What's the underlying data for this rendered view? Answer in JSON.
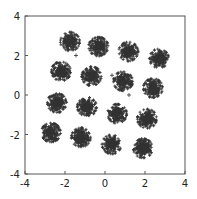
{
  "chart_data": {
    "type": "scatter",
    "title": "",
    "xlabel": "",
    "ylabel": "",
    "xlim": [
      -4,
      4
    ],
    "ylim": [
      -4,
      4
    ],
    "xticks": [
      -4,
      -2,
      0,
      2,
      4
    ],
    "yticks": [
      -4,
      -2,
      0,
      2,
      4
    ],
    "grid": false,
    "legend": null,
    "marker": "+",
    "color": "#333333",
    "cluster_spread": 0.28,
    "points_per_cluster": 260,
    "clusters": [
      {
        "x": -1.75,
        "y": 2.7
      },
      {
        "x": -0.33,
        "y": 2.45
      },
      {
        "x": 1.17,
        "y": 2.2
      },
      {
        "x": 2.7,
        "y": 1.85
      },
      {
        "x": -2.2,
        "y": 1.2
      },
      {
        "x": -0.67,
        "y": 0.95
      },
      {
        "x": 0.9,
        "y": 0.7
      },
      {
        "x": 2.4,
        "y": 0.35
      },
      {
        "x": -2.4,
        "y": -0.4
      },
      {
        "x": -0.9,
        "y": -0.6
      },
      {
        "x": 0.6,
        "y": -0.95
      },
      {
        "x": 2.1,
        "y": -1.2
      },
      {
        "x": -2.7,
        "y": -1.9
      },
      {
        "x": -1.2,
        "y": -2.15
      },
      {
        "x": 0.33,
        "y": -2.5
      },
      {
        "x": 1.9,
        "y": -2.7
      }
    ],
    "outliers": [
      {
        "x": -1.45,
        "y": 2.0
      },
      {
        "x": 0.35,
        "y": 1.0
      },
      {
        "x": 1.2,
        "y": 0.0
      },
      {
        "x": -1.5,
        "y": 2.7
      }
    ]
  }
}
